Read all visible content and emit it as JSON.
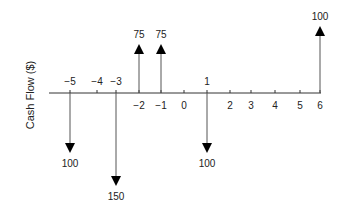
{
  "chart_data": {
    "type": "cash_flow_diagram",
    "title": "",
    "ylabel": "Cash Flow ($)",
    "xlabel": "",
    "periods": [
      -5,
      -4,
      -3,
      -2,
      -1,
      0,
      1,
      2,
      3,
      4,
      5,
      6
    ],
    "tick_labels_above": [
      "−5",
      "−4",
      "−3",
      "1"
    ],
    "tick_labels_below": [
      "−2",
      "−1",
      "0",
      "2",
      "3",
      "4",
      "5",
      "6"
    ],
    "flows": [
      {
        "period": -5,
        "amount": 100,
        "direction": "down",
        "label": "100"
      },
      {
        "period": -3,
        "amount": 150,
        "direction": "down",
        "label": "150"
      },
      {
        "period": -2,
        "amount": 75,
        "direction": "up",
        "label": "75"
      },
      {
        "period": -1,
        "amount": 75,
        "direction": "up",
        "label": "75"
      },
      {
        "period": 1,
        "amount": 100,
        "direction": "down",
        "label": "100"
      },
      {
        "period": 6,
        "amount": 100,
        "direction": "up",
        "label": "100"
      }
    ]
  },
  "axis_label": "Cash Flow ($)",
  "ticks": [
    {
      "label": "−5",
      "x": 70,
      "pos": "above"
    },
    {
      "label": "−4",
      "x": 97,
      "pos": "above"
    },
    {
      "label": "−3",
      "x": 116,
      "pos": "above"
    },
    {
      "label": "−2",
      "x": 139,
      "pos": "below"
    },
    {
      "label": "−1",
      "x": 161,
      "pos": "below"
    },
    {
      "label": "0",
      "x": 184,
      "pos": "below"
    },
    {
      "label": "1",
      "x": 207,
      "pos": "above"
    },
    {
      "label": "2",
      "x": 230,
      "pos": "below"
    },
    {
      "label": "3",
      "x": 251,
      "pos": "below"
    },
    {
      "label": "4",
      "x": 275,
      "pos": "below"
    },
    {
      "label": "5",
      "x": 300,
      "pos": "below"
    },
    {
      "label": "6",
      "x": 320,
      "pos": "below"
    }
  ],
  "arrows": [
    {
      "x": 70,
      "dir": "down",
      "tip": 153,
      "label": "100"
    },
    {
      "x": 116,
      "dir": "down",
      "tip": 186,
      "label": "150"
    },
    {
      "x": 139,
      "dir": "up",
      "tip": 44,
      "label": "75"
    },
    {
      "x": 161,
      "dir": "up",
      "tip": 44,
      "label": "75"
    },
    {
      "x": 207,
      "dir": "down",
      "tip": 153,
      "label": "100"
    },
    {
      "x": 320,
      "dir": "up",
      "tip": 26,
      "label": "100"
    }
  ]
}
